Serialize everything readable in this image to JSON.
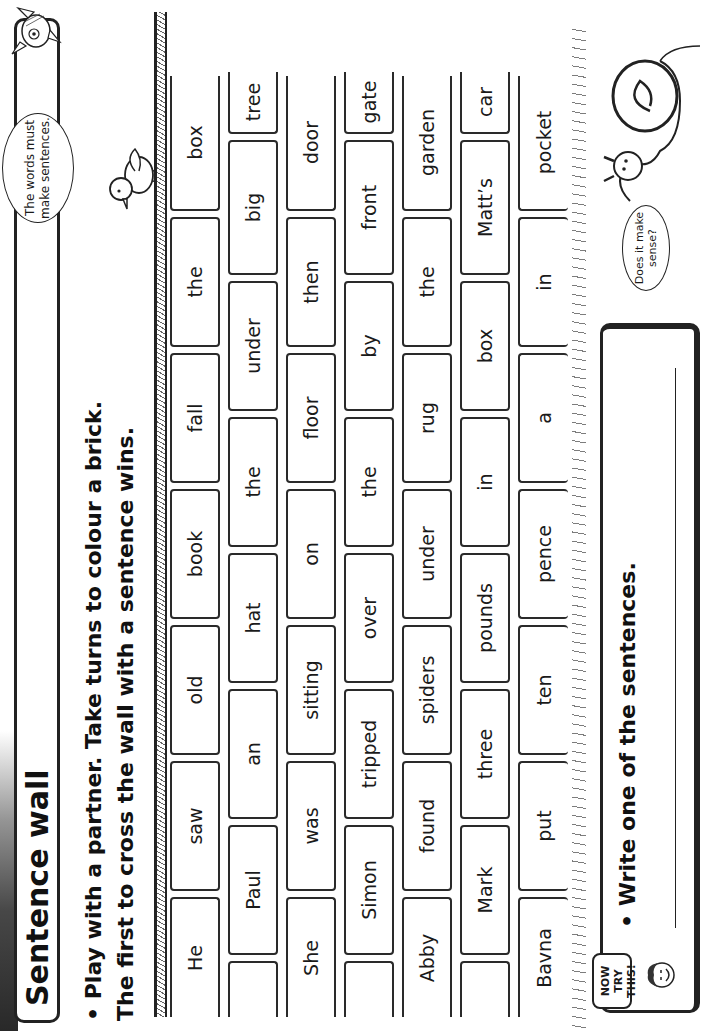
{
  "header": {
    "title": "Sentence wall"
  },
  "instructions": {
    "line1": "• Play with a partner. Take turns to colour a brick.",
    "line2": "The first to cross the wall with a sentence wins."
  },
  "speech_bubbles": {
    "top": "The words must make sentences.",
    "snail": "Does it make sense?"
  },
  "wall": {
    "rows": [
      {
        "offset": "full",
        "bricks": [
          "He",
          "saw",
          "old",
          "book",
          "fall",
          "the",
          "box"
        ]
      },
      {
        "offset": "half",
        "bricks": [
          "",
          "Paul",
          "an",
          "hat",
          "the",
          "under",
          "big",
          "tree"
        ]
      },
      {
        "offset": "full",
        "bricks": [
          "She",
          "was",
          "sitting",
          "on",
          "floor",
          "then",
          "door"
        ]
      },
      {
        "offset": "half",
        "bricks": [
          "",
          "Simon",
          "tripped",
          "over",
          "the",
          "by",
          "front",
          "gate"
        ]
      },
      {
        "offset": "full",
        "bricks": [
          "Abby",
          "found",
          "spiders",
          "under",
          "rug",
          "the",
          "garden"
        ]
      },
      {
        "offset": "half",
        "bricks": [
          "",
          "Mark",
          "three",
          "pounds",
          "in",
          "box",
          "Matt’s",
          "car"
        ]
      },
      {
        "offset": "full",
        "bricks": [
          "Bavna",
          "put",
          "ten",
          "pence",
          "a",
          "in",
          "pocket"
        ]
      }
    ]
  },
  "task": {
    "badge": "NOW TRY THIS!",
    "badge_line1": "NOW TRY",
    "badge_line2": "THIS!",
    "prompt": "• Write one of the sentences.",
    "answer_value": ""
  }
}
